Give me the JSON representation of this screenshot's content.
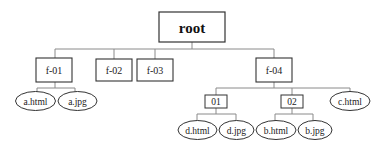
{
  "diagram": {
    "type": "tree",
    "colors": {
      "stroke": "#333333",
      "connector": "#888888",
      "text": "#222222",
      "background": "#ffffff"
    },
    "root": {
      "label": "root"
    },
    "folders": {
      "f01": {
        "label": "f-01"
      },
      "f02": {
        "label": "f-02"
      },
      "f03": {
        "label": "f-03"
      },
      "f04": {
        "label": "f-04"
      },
      "sub01": {
        "label": "01"
      },
      "sub02": {
        "label": "02"
      }
    },
    "files": {
      "a_html": {
        "label": "a.html"
      },
      "a_jpg": {
        "label": "a.jpg"
      },
      "c_html": {
        "label": "c.html"
      },
      "d_html": {
        "label": "d.html"
      },
      "d_jpg": {
        "label": "d.jpg"
      },
      "b_html": {
        "label": "b.html"
      },
      "b_jpg": {
        "label": "b.jpg"
      }
    },
    "edges": [
      [
        "root",
        "f-01"
      ],
      [
        "root",
        "f-02"
      ],
      [
        "root",
        "f-03"
      ],
      [
        "root",
        "f-04"
      ],
      [
        "f-01",
        "a.html"
      ],
      [
        "f-01",
        "a.jpg"
      ],
      [
        "f-04",
        "01"
      ],
      [
        "f-04",
        "02"
      ],
      [
        "f-04",
        "c.html"
      ],
      [
        "01",
        "d.html"
      ],
      [
        "01",
        "d.jpg"
      ],
      [
        "02",
        "b.html"
      ],
      [
        "02",
        "b.jpg"
      ]
    ]
  }
}
